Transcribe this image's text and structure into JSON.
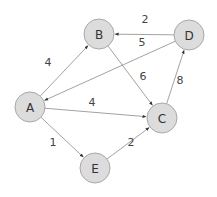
{
  "graph": {
    "type": "directed-weighted",
    "colors": {
      "node_fill": "#dcdcdc",
      "node_stroke": "#a8a8a8",
      "edge": "#8a8a8a",
      "label": "#333333"
    },
    "nodes": [
      {
        "id": "A",
        "label": "A",
        "x": 30,
        "y": 107
      },
      {
        "id": "B",
        "label": "B",
        "x": 99,
        "y": 34
      },
      {
        "id": "C",
        "label": "C",
        "x": 162,
        "y": 118
      },
      {
        "id": "D",
        "label": "D",
        "x": 189,
        "y": 35
      },
      {
        "id": "E",
        "label": "E",
        "x": 95,
        "y": 168
      }
    ],
    "edges": [
      {
        "from": "A",
        "to": "B",
        "weight": "4",
        "lx": 48,
        "ly": 62
      },
      {
        "from": "D",
        "to": "B",
        "weight": "2",
        "lx": 145,
        "ly": 19
      },
      {
        "from": "D",
        "to": "A",
        "weight": "5",
        "lx": 142,
        "ly": 42
      },
      {
        "from": "B",
        "to": "C",
        "weight": "6",
        "lx": 143,
        "ly": 76
      },
      {
        "from": "C",
        "to": "D",
        "weight": "8",
        "lx": 180,
        "ly": 80
      },
      {
        "from": "A",
        "to": "C",
        "weight": "4",
        "lx": 92,
        "ly": 102
      },
      {
        "from": "A",
        "to": "E",
        "weight": "1",
        "lx": 53,
        "ly": 142
      },
      {
        "from": "E",
        "to": "C",
        "weight": "2",
        "lx": 131,
        "ly": 142
      }
    ]
  }
}
